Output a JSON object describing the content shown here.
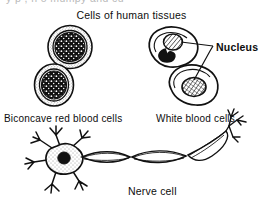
{
  "figure": {
    "title": "Cells of human tissues",
    "cropped_top_text": "y p , n  o  mumpy and cu",
    "labels": {
      "red_blood_cells": "Biconcave red blood cells",
      "white_blood_cells": "White blood cells",
      "nucleus": "Nucleus",
      "nerve_cell": "Nerve cell"
    },
    "colors": {
      "ink": "#0d0d0d",
      "paper": "#ffffff",
      "nucleus_fill": "#111111",
      "cytoplasm_stipple": "#2b2b2b"
    },
    "parts": {
      "red_blood_cell_count": 2,
      "white_blood_cell_count": 2,
      "nerve_cell_count": 1,
      "leader_line_count": 2
    }
  }
}
